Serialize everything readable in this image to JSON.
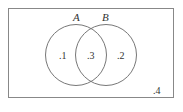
{
  "diagram": {
    "type": "venn",
    "universe": {
      "label": "",
      "outside_probability": ".4"
    },
    "sets": [
      {
        "name": "A",
        "only_probability": ".1"
      },
      {
        "name": "B",
        "only_probability": ".2"
      }
    ],
    "intersection_probability": ".3",
    "colors": {
      "stroke": "#777777",
      "background": "#ffffff",
      "text": "#333333"
    }
  }
}
